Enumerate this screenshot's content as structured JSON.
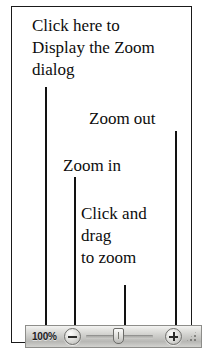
{
  "figure": {
    "callouts": [
      {
        "id": "dialog",
        "text": "Click here to\nDisplay the Zoom\ndialog"
      },
      {
        "id": "zoomout",
        "text": "Zoom out"
      },
      {
        "id": "zoomin",
        "text": "Zoom in"
      },
      {
        "id": "drag",
        "text": "Click and\ndrag\nto zoom"
      }
    ]
  },
  "zoom_bar": {
    "zoom_level": "100%",
    "zoom_out_label": "−",
    "zoom_in_label": "+",
    "slider_position_percent": 48,
    "resize_grip": "resize-grip"
  },
  "colors": {
    "frame_border": "#1a1a1a",
    "text": "#0d0d0d",
    "leader_line": "#121212",
    "bar_background": "#c9c9c6",
    "bar_border": "#8d8d8a"
  }
}
